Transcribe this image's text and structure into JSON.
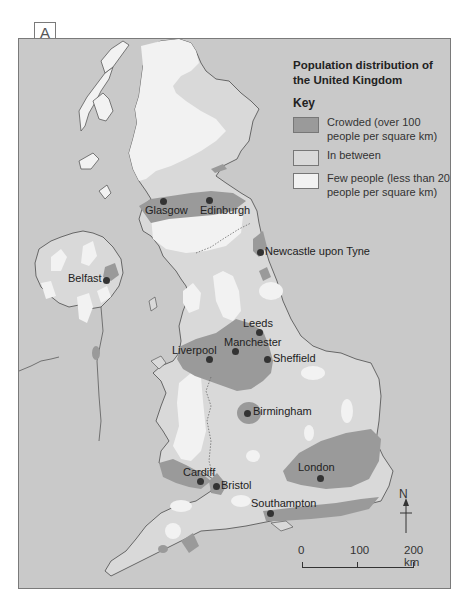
{
  "figure": {
    "label": "A"
  },
  "legend": {
    "title": "Population distribution of the United Kingdom",
    "key_heading": "Key",
    "items": [
      {
        "label": "Crowded (over 100 people per square km)",
        "color": "#9a9a9a"
      },
      {
        "label": "In between",
        "color": "#d9d9d9"
      },
      {
        "label": "Few people (less than 20 people per square km)",
        "color": "#f2f2f2"
      }
    ]
  },
  "colors": {
    "sea": "#c9c9c9",
    "coastline": "#5a5a5a",
    "city_dot": "#333333"
  },
  "cities": [
    {
      "name": "Glasgow"
    },
    {
      "name": "Edinburgh"
    },
    {
      "name": "Newcastle upon Tyne"
    },
    {
      "name": "Belfast"
    },
    {
      "name": "Leeds"
    },
    {
      "name": "Manchester"
    },
    {
      "name": "Liverpool"
    },
    {
      "name": "Sheffield"
    },
    {
      "name": "Birmingham"
    },
    {
      "name": "Cardiff"
    },
    {
      "name": "Bristol"
    },
    {
      "name": "London"
    },
    {
      "name": "Southampton"
    }
  ],
  "compass": {
    "label": "N"
  },
  "scale": {
    "ticks": [
      "0",
      "100",
      "200 km"
    ]
  }
}
